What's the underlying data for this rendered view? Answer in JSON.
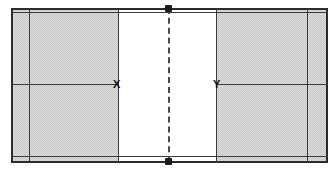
{
  "diagram": {
    "canvas": {
      "width": 336,
      "height": 172,
      "background": "#ffffff"
    },
    "colors": {
      "line": "#3a3a3a",
      "line_bold": "#2b2b2b",
      "shade_fill": "#dcdcdc",
      "shade_hatch": "#c9c9c9",
      "marker_text": "#111111",
      "post": "#1c1c1c",
      "dash_line": "#4a4a4a"
    },
    "court": {
      "left": 11,
      "right": 327,
      "top": 8,
      "bottom": 162,
      "left_sideline_x": 29,
      "right_sideline_x": 307,
      "top_inner_line_y": 12,
      "bottom_inner_line_y": 156,
      "centre_line_y": 84
    },
    "shaded_zones": [
      {
        "name": "left-service-zone",
        "x": 11,
        "y": 8,
        "width": 107,
        "height": 154
      },
      {
        "name": "right-service-zone",
        "x": 216,
        "y": 8,
        "width": 111,
        "height": 154
      }
    ],
    "net": {
      "x": 168,
      "top_y": 8,
      "bottom_y": 162,
      "style": "dashed"
    },
    "markers": [
      {
        "label": "X",
        "x": 118,
        "y": 84
      },
      {
        "label": "Y",
        "x": 216,
        "y": 84
      }
    ],
    "net_posts": [
      {
        "name": "net-post-top",
        "x": 168,
        "y": 8
      },
      {
        "name": "net-post-bottom",
        "x": 168,
        "y": 162
      }
    ],
    "segments": {
      "centre_left_label": "centre line left segment",
      "centre_right_label": "centre line right segment"
    }
  }
}
